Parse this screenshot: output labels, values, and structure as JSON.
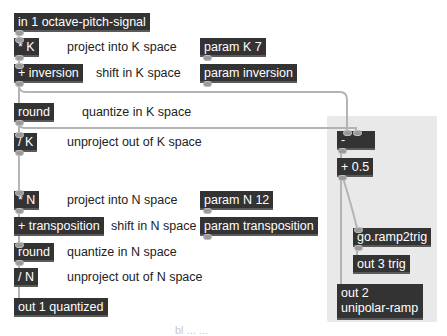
{
  "patcher": {
    "objects": {
      "inlet": "in 1 octave-pitch-signal",
      "mul_k": "* K",
      "add_inversion": "+ inversion",
      "round_k": "round",
      "div_k": "/ K",
      "mul_n": "* N",
      "add_transposition": "+ transposition",
      "round_n": "round",
      "div_n": "/ N",
      "out_quantized": "out 1 quantized",
      "param_k": "param K 7",
      "param_inversion": "param inversion",
      "param_n": "param N 12",
      "param_transposition": "param transposition",
      "minus": "-",
      "plus_half": "+ 0.5",
      "ramp2trig": "go.ramp2trig",
      "out_trig": "out 3 trig",
      "out_ramp_line1": "out 2",
      "out_ramp_line2": "unipolar-ramp"
    },
    "comments": {
      "project_k": "project into K space",
      "shift_k": "shift in K space",
      "quantize_k": "quantize in K space",
      "unproject_k": "unproject out of K space",
      "project_n": "project into N space",
      "shift_n": "shift in N space",
      "quantize_n": "quantize in N space",
      "unproject_n": "unproject out of N space"
    },
    "footer_text": "bl ... ..."
  },
  "colors": {
    "object_bg": "#333333",
    "object_text": "#ffffff",
    "cord": "#b0b0b0",
    "panel_bg": "#e9e9e9",
    "background": "#ffffff"
  }
}
